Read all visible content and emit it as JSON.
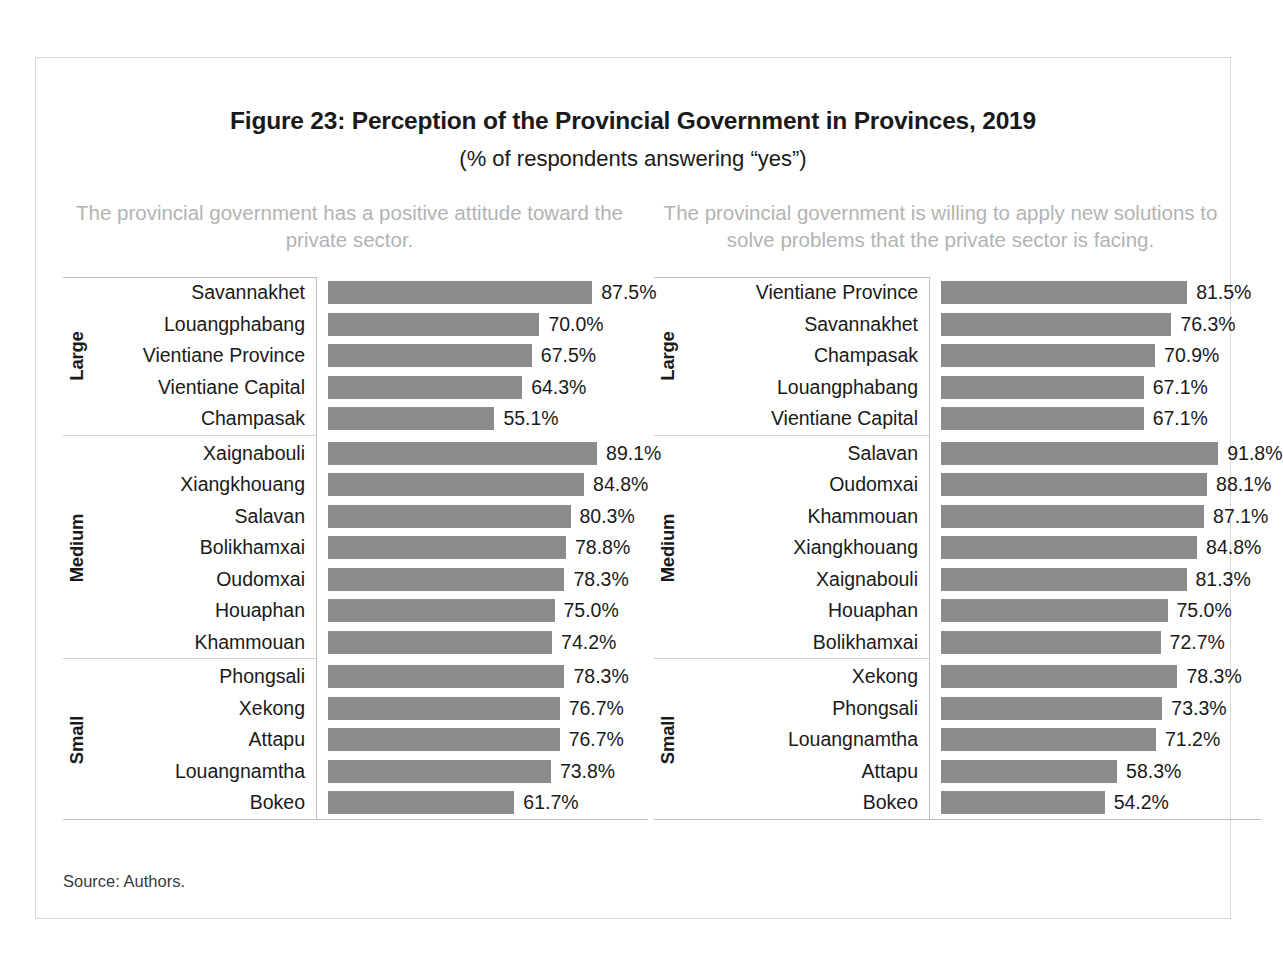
{
  "figure": {
    "title": "Figure 23: Perception of the Provincial Government in Provinces, 2019",
    "subtitle": "(% of respondents answering “yes”)",
    "source": "Source: Authors.",
    "bar_color": "#8c8c8c",
    "heading_color": "#b3b3b3",
    "axis_color": "#bfbfbf"
  },
  "chart_data": [
    {
      "type": "bar",
      "orientation": "horizontal",
      "title": "The provincial government has a positive attitude toward the private sector.",
      "xlabel": "",
      "ylabel": "",
      "xlim": [
        0,
        100
      ],
      "grid": false,
      "legend": "none",
      "value_suffix": "%",
      "groups": [
        {
          "name": "Large",
          "categories": [
            "Savannakhet",
            "Louangphabang",
            "Vientiane Province",
            "Vientiane Capital",
            "Champasak"
          ],
          "values": [
            87.5,
            70.0,
            67.5,
            64.3,
            55.1
          ],
          "labels": [
            "87.5%",
            "70.0%",
            "67.5%",
            "64.3%",
            "55.1%"
          ]
        },
        {
          "name": "Medium",
          "categories": [
            "Xaignabouli",
            "Xiangkhouang",
            "Salavan",
            "Bolikhamxai",
            "Oudomxai",
            "Houaphan",
            "Khammouan"
          ],
          "values": [
            89.1,
            84.8,
            80.3,
            78.8,
            78.3,
            75.0,
            74.2
          ],
          "labels": [
            "89.1%",
            "84.8%",
            "80.3%",
            "78.8%",
            "78.3%",
            "75.0%",
            "74.2%"
          ]
        },
        {
          "name": "Small",
          "categories": [
            "Phongsali",
            "Xekong",
            "Attapu",
            "Louangnamtha",
            "Bokeo"
          ],
          "values": [
            78.3,
            76.7,
            76.7,
            73.8,
            61.7
          ],
          "labels": [
            "78.3%",
            "76.7%",
            "76.7%",
            "73.8%",
            "61.7%"
          ]
        }
      ]
    },
    {
      "type": "bar",
      "orientation": "horizontal",
      "title": "The provincial government is willing to apply new solutions to solve problems that the private sector is facing.",
      "xlabel": "",
      "ylabel": "",
      "xlim": [
        0,
        100
      ],
      "grid": false,
      "legend": "none",
      "value_suffix": "%",
      "groups": [
        {
          "name": "Large",
          "categories": [
            "Vientiane Province",
            "Savannakhet",
            "Champasak",
            "Louangphabang",
            "Vientiane Capital"
          ],
          "values": [
            81.5,
            76.3,
            70.9,
            67.1,
            67.1
          ],
          "labels": [
            "81.5%",
            "76.3%",
            "70.9%",
            "67.1%",
            "67.1%"
          ]
        },
        {
          "name": "Medium",
          "categories": [
            "Salavan",
            "Oudomxai",
            "Khammouan",
            "Xiangkhouang",
            "Xaignabouli",
            "Houaphan",
            "Bolikhamxai"
          ],
          "values": [
            91.8,
            88.1,
            87.1,
            84.8,
            81.3,
            75.0,
            72.7
          ],
          "labels": [
            "91.8%",
            "88.1%",
            "87.1%",
            "84.8%",
            "81.3%",
            "75.0%",
            "72.7%"
          ]
        },
        {
          "name": "Small",
          "categories": [
            "Xekong",
            "Phongsali",
            "Louangnamtha",
            "Attapu",
            "Bokeo"
          ],
          "values": [
            78.3,
            73.3,
            71.2,
            58.3,
            54.2
          ],
          "labels": [
            "78.3%",
            "73.3%",
            "71.2%",
            "58.3%",
            "54.2%"
          ]
        }
      ]
    }
  ]
}
